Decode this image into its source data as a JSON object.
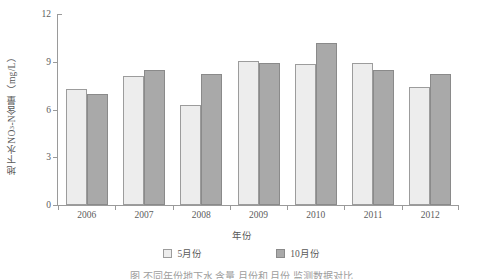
{
  "chart_data": {
    "type": "bar",
    "title": "",
    "xlabel": "年份",
    "ylabel": "地下水NO3-N含量（mg/L）",
    "ylabel_main": "地下水NO",
    "ylabel_sub": "3",
    "ylabel_tail": "-N含量（mg/L）",
    "categories": [
      "2006",
      "2007",
      "2008",
      "2009",
      "2010",
      "2011",
      "2012"
    ],
    "series": [
      {
        "name": "5月份",
        "values": [
          7.3,
          8.1,
          6.3,
          9.05,
          8.85,
          8.9,
          7.4
        ],
        "color": "#ededed"
      },
      {
        "name": "10月份",
        "values": [
          7.0,
          8.5,
          8.2,
          8.9,
          10.2,
          8.5,
          8.25
        ],
        "color": "#a9a9a9"
      }
    ],
    "ylim": [
      0,
      12
    ],
    "yticks": [
      0,
      3,
      6,
      9,
      12
    ],
    "ytick_labels": [
      "0",
      "3",
      "6",
      "9",
      "12"
    ],
    "grid": false,
    "legend_position": "bottom"
  },
  "legend": {
    "items": [
      {
        "label": "5月份",
        "swatch": "may"
      },
      {
        "label": "10月份",
        "swatch": "oct"
      }
    ]
  },
  "caption": {
    "text": "图      不同年份地下水  含量    月份和    月份  监测数据对比"
  }
}
